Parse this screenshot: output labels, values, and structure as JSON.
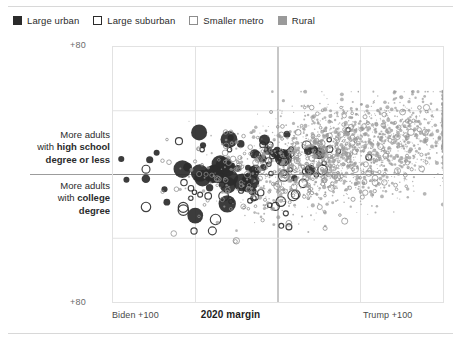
{
  "legend": {
    "items": [
      {
        "label": "Large urban",
        "marker": "filled-dark-square",
        "color": "#2b2b2b"
      },
      {
        "label": "Large suburban",
        "marker": "open-dark-square",
        "color": "#2b2b2b"
      },
      {
        "label": "Smaller metro",
        "marker": "open-light-square",
        "color": "#8d8d8d"
      },
      {
        "label": "Rural",
        "marker": "filled-gray-square",
        "color": "#9a9a9a"
      }
    ]
  },
  "axes": {
    "y_top_tick": "+80",
    "y_bottom_tick": "+80",
    "y_upper_label_line1": "More adults",
    "y_upper_label_line2_bold": "high school",
    "y_upper_label_line2_pre": "with ",
    "y_upper_label_line3_bold": "degree or less",
    "y_lower_label_line1": "More adults",
    "y_lower_label_line2_pre": "with ",
    "y_lower_label_line2_bold": "college",
    "y_lower_label_line3_bold": "degree",
    "x_left_label": "Biden +100",
    "x_center_label": "2020 margin",
    "x_right_label": "Trump +100"
  },
  "chart_data": {
    "type": "scatter",
    "title": "",
    "xlabel": "2020 margin",
    "ylabel": "Education composition",
    "xlim": [
      -100,
      100
    ],
    "ylim": [
      -80,
      80
    ],
    "xticks": [
      -100,
      100
    ],
    "xticklabels": [
      "Biden +100",
      "Trump +100"
    ],
    "yticks": [
      80,
      -80
    ],
    "yticklabels": [
      "+80",
      "+80"
    ],
    "grid": true,
    "gridlines_x": [
      -50,
      0,
      50
    ],
    "gridlines_y": [
      40,
      0,
      -40
    ],
    "center_axis_x": 0,
    "center_axis_y": 0,
    "legend_position": "above-plot-left",
    "marker_size_encodes": "population",
    "series": [
      {
        "name": "Large urban",
        "style": "filled",
        "color": "#2b2b2b",
        "count": 52,
        "x_range": [
          -95,
          35
        ],
        "y_range": [
          -45,
          30
        ],
        "cluster_center": [
          -28,
          3
        ],
        "size_range": [
          3.0,
          9.0
        ],
        "seed": 11
      },
      {
        "name": "Large suburban",
        "style": "open",
        "color": "#2b2b2b",
        "count": 62,
        "x_range": [
          -80,
          55
        ],
        "y_range": [
          -45,
          28
        ],
        "cluster_center": [
          -18,
          -2
        ],
        "size_range": [
          2.2,
          5.4
        ],
        "seed": 23
      },
      {
        "name": "Smaller metro",
        "style": "open",
        "color": "#8d8d8d",
        "count": 320,
        "x_range": [
          -70,
          90
        ],
        "y_range": [
          -42,
          42
        ],
        "cluster_center": [
          18,
          8
        ],
        "size_range": [
          1.3,
          3.4
        ],
        "seed": 37
      },
      {
        "name": "Rural",
        "style": "filled",
        "color": "#9a9a9a",
        "count": 1650,
        "x_range": [
          -60,
          100
        ],
        "y_range": [
          -40,
          52
        ],
        "cluster_center": [
          46,
          16
        ],
        "size_range": [
          0.55,
          2.1
        ],
        "seed": 59
      }
    ]
  }
}
